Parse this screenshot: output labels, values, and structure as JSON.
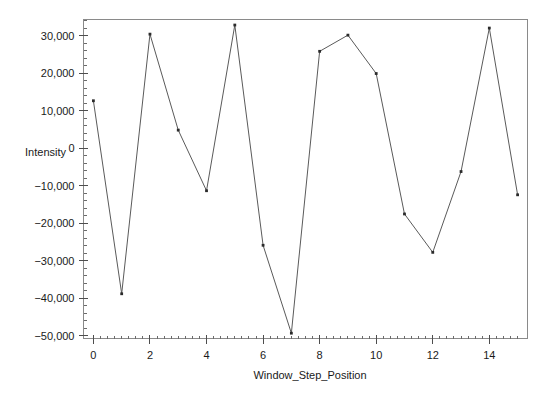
{
  "chart_data": {
    "type": "line",
    "title": "",
    "xlabel": "Window_Step_Position",
    "ylabel": "Intensity",
    "x": [
      0,
      1,
      2,
      3,
      4,
      5,
      6,
      7,
      8,
      9,
      10,
      11,
      12,
      13,
      14,
      15
    ],
    "values": [
      12700,
      -38850,
      30490,
      4860,
      -11330,
      32920,
      -25900,
      -49380,
      25900,
      30220,
      19970,
      -17540,
      -27790,
      -6210,
      32110,
      -12420
    ],
    "series": [
      {
        "name": "Intensity",
        "values": [
          12700,
          -38850,
          30490,
          4860,
          -11330,
          32920,
          -25900,
          -49380,
          25900,
          30220,
          19970,
          -17540,
          -27790,
          -6210,
          32110,
          -12420
        ]
      }
    ],
    "xlim": [
      -0.35,
      15.35
    ],
    "ylim": [
      -50800,
      34400
    ],
    "x_ticks": [
      0,
      2,
      4,
      6,
      8,
      10,
      12,
      14
    ],
    "x_tick_labels": [
      "0",
      "2",
      "4",
      "6",
      "8",
      "10",
      "12",
      "14"
    ],
    "x_minor_step": 0.25,
    "y_ticks": [
      30000,
      20000,
      10000,
      0,
      -10000,
      -20000,
      -30000,
      -40000,
      -50000
    ],
    "y_tick_labels": [
      "30,000",
      "20,000",
      "10,000",
      "0",
      "−10,000",
      "−20,000",
      "−30,000",
      "−40,000",
      "−50,000"
    ],
    "y_minor_step": 2000,
    "grid": false,
    "legend": "none",
    "marker": "dot",
    "line_color": "#5a5a5a",
    "marker_color": "#2b2b2b",
    "background_color": "#ffffff"
  }
}
